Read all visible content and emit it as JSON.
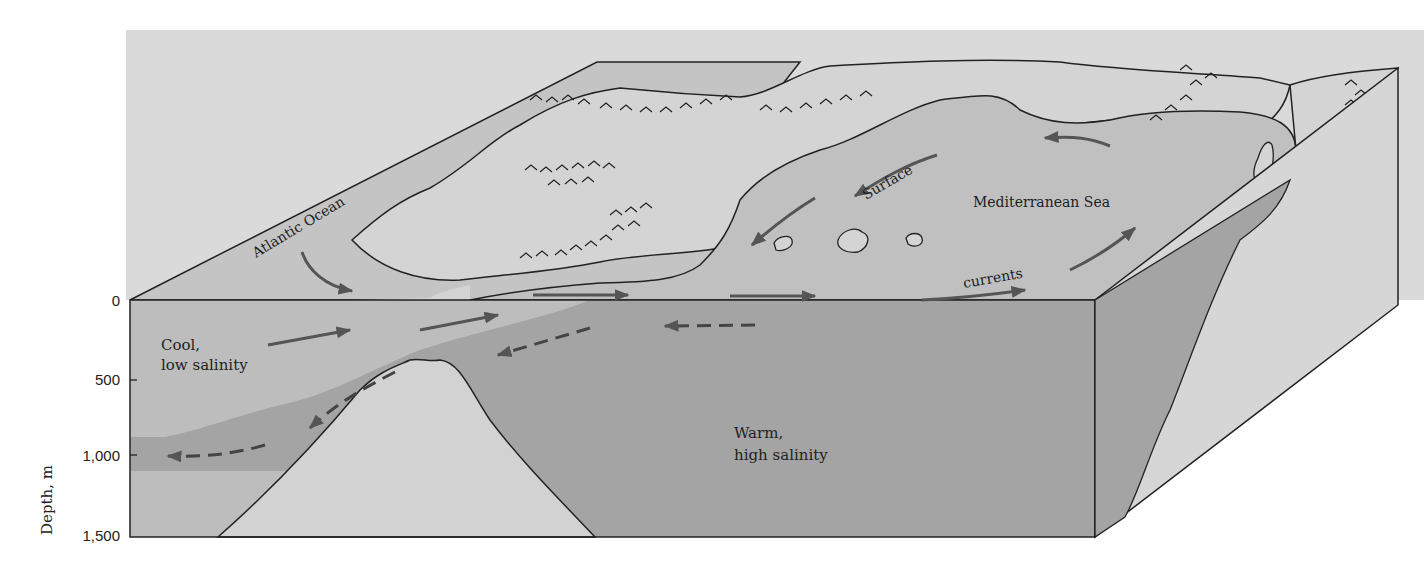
{
  "diagram": {
    "colors": {
      "background_panel": "#dadada",
      "land": "#d4d4d4",
      "atlantic_surface": "#c4c4c4",
      "mediterranean_surface": "#c0c0c0",
      "cool_water": "#bdbdbd",
      "warm_water": "#a4a4a4",
      "seafloor": "#d2d2d2",
      "right_face_land": "#d6d6d6",
      "arrow": "#555555",
      "outline": "#222222"
    },
    "labels": {
      "atlantic": "Atlantic Ocean",
      "mediterranean": "Mediterranean Sea",
      "surface": "Surface",
      "currents": "currents",
      "cool_line1": "Cool,",
      "cool_line2": "low salinity",
      "warm_line1": "Warm,",
      "warm_line2": "high salinity"
    },
    "depth_axis": {
      "label": "Depth, m",
      "ticks": [
        "0",
        "500",
        "1,000",
        "1,500"
      ]
    }
  }
}
